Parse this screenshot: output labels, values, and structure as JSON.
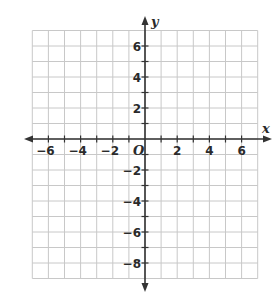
{
  "diagram": {
    "type": "coordinate-plane",
    "x_axis": {
      "label": "x",
      "min": -7,
      "max": 7,
      "tick_labels": [
        "−6",
        "−4",
        "−2",
        "2",
        "4",
        "6"
      ],
      "tick_values": [
        -6,
        -4,
        -2,
        2,
        4,
        6
      ]
    },
    "y_axis": {
      "label": "y",
      "min": -9,
      "max": 7,
      "tick_labels": [
        "6",
        "4",
        "2",
        "−2",
        "−4",
        "−6",
        "−8"
      ],
      "tick_values": [
        6,
        4,
        2,
        -2,
        -4,
        -6,
        -8
      ]
    },
    "origin_label": "O",
    "grid": {
      "on": true,
      "spacing": 1
    },
    "colors": {
      "grid": "#c8c8c8",
      "axis": "#333333",
      "text": "#2a2a2a",
      "background": "#ffffff"
    }
  }
}
